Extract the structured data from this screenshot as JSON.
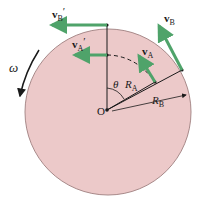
{
  "diagram": {
    "colors": {
      "disk_fill": "#ecc9c9",
      "disk_edge": "#a88a8a",
      "vector": "#4fa36a",
      "line": "#1a1a1a"
    },
    "labels": {
      "vB_prime": "v",
      "vB_prime_sub": "B",
      "vB_prime_mark": "′",
      "vA_prime": "v",
      "vA_prime_sub": "A",
      "vA_prime_mark": "′",
      "vA": "v",
      "vA_sub": "A",
      "vB": "v",
      "vB_sub": "B",
      "omega": "ω",
      "theta": "θ",
      "RA": "R",
      "RA_sub": "A",
      "RB": "R",
      "RB_sub": "B",
      "origin": "O"
    }
  }
}
